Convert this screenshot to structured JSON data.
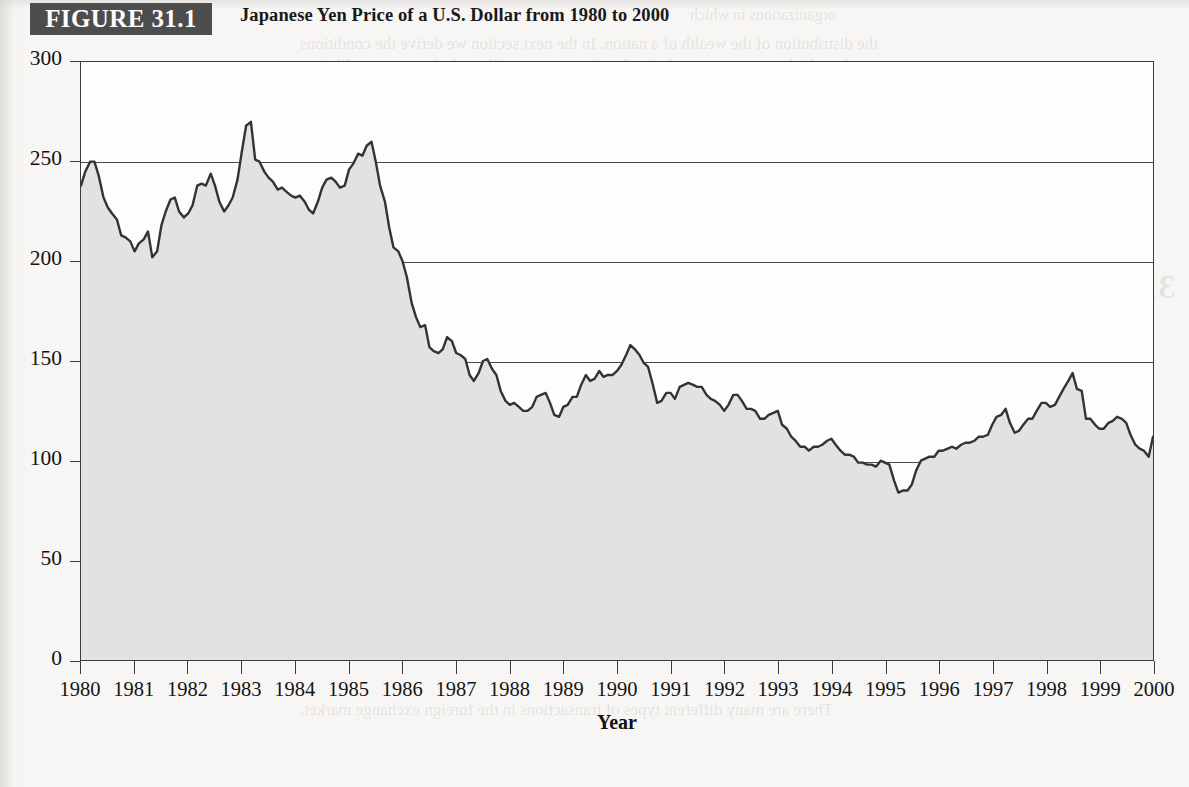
{
  "figure": {
    "tag": "FIGURE 31.1",
    "title": "Japanese Yen Price of a U.S. Dollar from 1980 to 2000"
  },
  "colors": {
    "tag_background": "#4d4d4d",
    "tag_text": "#fdfdfd",
    "line": "#333333",
    "area_fill": "#e2e2e0",
    "plot_background": "#fdfdfc",
    "axis": "#3b3b3b",
    "page_background": "#f7f6f4"
  },
  "axis_title": "Year",
  "chart_data": {
    "type": "area",
    "title": "Japanese Yen Price of a U.S. Dollar from 1980 to 2000",
    "xlabel": "Year",
    "ylabel": "",
    "xlim": [
      1980,
      2000
    ],
    "ylim": [
      0,
      300
    ],
    "yticks": [
      0,
      50,
      100,
      150,
      200,
      250,
      300
    ],
    "ytick_labels": [
      "0",
      "50",
      "100",
      "150",
      "200",
      "250",
      "300"
    ],
    "xticks": [
      1980,
      1981,
      1982,
      1983,
      1984,
      1985,
      1986,
      1987,
      1988,
      1989,
      1990,
      1991,
      1992,
      1993,
      1994,
      1995,
      1996,
      1997,
      1998,
      1999,
      2000
    ],
    "xtick_labels": [
      "1980",
      "1981",
      "1982",
      "1983",
      "1984",
      "1985",
      "1986",
      "1987",
      "1988",
      "1989",
      "1990",
      "1991",
      "1992",
      "1993",
      "1994",
      "1995",
      "1996",
      "1997",
      "1998",
      "1999",
      "2000"
    ],
    "grid": "horizontal gridlines at 50,100,150,200,250",
    "legend": null,
    "series_name": "Yen per U.S. Dollar",
    "annotations": [],
    "notes": [
      "Area under the line is shaded light gray.",
      "Sharp depreciation of the dollar after the 1985 Plaza Accord.",
      "All-time low of about 84 yen per dollar in April 1995."
    ],
    "x": [
      1980.0,
      1980.08,
      1980.17,
      1980.25,
      1980.33,
      1980.42,
      1980.5,
      1980.58,
      1980.67,
      1980.75,
      1980.83,
      1980.92,
      1981.0,
      1981.08,
      1981.17,
      1981.25,
      1981.33,
      1981.42,
      1981.5,
      1981.58,
      1981.67,
      1981.75,
      1981.83,
      1981.92,
      1982.0,
      1982.08,
      1982.17,
      1982.25,
      1982.33,
      1982.42,
      1982.5,
      1982.58,
      1982.67,
      1982.75,
      1982.83,
      1982.92,
      1983.0,
      1983.08,
      1983.17,
      1983.25,
      1983.33,
      1983.42,
      1983.5,
      1983.58,
      1983.67,
      1983.75,
      1983.83,
      1983.92,
      1984.0,
      1984.08,
      1984.17,
      1984.25,
      1984.33,
      1984.42,
      1984.5,
      1984.58,
      1984.67,
      1984.75,
      1984.83,
      1984.92,
      1985.0,
      1985.08,
      1985.17,
      1985.25,
      1985.33,
      1985.42,
      1985.5,
      1985.58,
      1985.67,
      1985.75,
      1985.83,
      1985.92,
      1986.0,
      1986.08,
      1986.17,
      1986.25,
      1986.33,
      1986.42,
      1986.5,
      1986.58,
      1986.67,
      1986.75,
      1986.83,
      1986.92,
      1987.0,
      1987.08,
      1987.17,
      1987.25,
      1987.33,
      1987.42,
      1987.5,
      1987.58,
      1987.67,
      1987.75,
      1987.83,
      1987.92,
      1988.0,
      1988.08,
      1988.17,
      1988.25,
      1988.33,
      1988.42,
      1988.5,
      1988.58,
      1988.67,
      1988.75,
      1988.83,
      1988.92,
      1989.0,
      1989.08,
      1989.17,
      1989.25,
      1989.33,
      1989.42,
      1989.5,
      1989.58,
      1989.67,
      1989.75,
      1989.83,
      1989.92,
      1990.0,
      1990.08,
      1990.17,
      1990.25,
      1990.33,
      1990.42,
      1990.5,
      1990.58,
      1990.67,
      1990.75,
      1990.83,
      1990.92,
      1991.0,
      1991.08,
      1991.17,
      1991.25,
      1991.33,
      1991.42,
      1991.5,
      1991.58,
      1991.67,
      1991.75,
      1991.83,
      1991.92,
      1992.0,
      1992.08,
      1992.17,
      1992.25,
      1992.33,
      1992.42,
      1992.5,
      1992.58,
      1992.67,
      1992.75,
      1992.83,
      1992.92,
      1993.0,
      1993.08,
      1993.17,
      1993.25,
      1993.33,
      1993.42,
      1993.5,
      1993.58,
      1993.67,
      1993.75,
      1993.83,
      1993.92,
      1994.0,
      1994.08,
      1994.17,
      1994.25,
      1994.33,
      1994.42,
      1994.5,
      1994.58,
      1994.67,
      1994.75,
      1994.83,
      1994.92,
      1995.0,
      1995.08,
      1995.17,
      1995.25,
      1995.33,
      1995.42,
      1995.5,
      1995.58,
      1995.67,
      1995.75,
      1995.83,
      1995.92,
      1996.0,
      1996.08,
      1996.17,
      1996.25,
      1996.33,
      1996.42,
      1996.5,
      1996.58,
      1996.67,
      1996.75,
      1996.83,
      1996.92,
      1997.0,
      1997.08,
      1997.17,
      1997.25,
      1997.33,
      1997.42,
      1997.5,
      1997.58,
      1997.67,
      1997.75,
      1997.83,
      1997.92,
      1998.0,
      1998.08,
      1998.17,
      1998.25,
      1998.33,
      1998.42,
      1998.5,
      1998.58,
      1998.67,
      1998.75,
      1998.83,
      1998.92,
      1999.0,
      1999.08,
      1999.17,
      1999.25,
      1999.33,
      1999.42,
      1999.5,
      1999.58,
      1999.67,
      1999.75,
      1999.83,
      1999.92,
      2000.0
    ],
    "values": [
      238,
      245,
      250,
      250,
      243,
      232,
      227,
      224,
      221,
      213,
      212,
      210,
      205,
      209,
      211,
      215,
      202,
      205,
      218,
      225,
      231,
      232,
      225,
      222,
      224,
      228,
      238,
      239,
      238,
      244,
      238,
      230,
      225,
      228,
      232,
      241,
      255,
      268,
      270,
      251,
      250,
      245,
      242,
      240,
      236,
      237,
      235,
      233,
      232,
      233,
      230,
      226,
      224,
      230,
      237,
      241,
      242,
      240,
      237,
      238,
      246,
      249,
      254,
      253,
      258,
      260,
      250,
      238,
      230,
      217,
      207,
      205,
      200,
      192,
      179,
      172,
      167,
      168,
      157,
      155,
      154,
      156,
      162,
      160,
      154,
      153,
      151,
      143,
      140,
      144,
      150,
      151,
      146,
      143,
      135,
      130,
      128,
      129,
      127,
      125,
      125,
      127,
      132,
      133,
      134,
      129,
      123,
      122,
      127,
      128,
      132,
      132,
      138,
      143,
      140,
      141,
      145,
      142,
      143,
      143,
      145,
      148,
      153,
      158,
      156,
      153,
      149,
      147,
      138,
      129,
      130,
      134,
      134,
      131,
      137,
      138,
      139,
      138,
      137,
      137,
      133,
      131,
      130,
      128,
      125,
      128,
      133,
      133,
      130,
      126,
      126,
      125,
      121,
      121,
      123,
      124,
      125,
      118,
      116,
      112,
      110,
      107,
      107,
      105,
      107,
      107,
      108,
      110,
      111,
      108,
      105,
      103,
      103,
      102,
      99,
      99,
      98,
      98,
      97,
      100,
      99,
      98,
      90,
      84,
      85,
      85,
      88,
      95,
      100,
      101,
      102,
      102,
      105,
      105,
      106,
      107,
      106,
      108,
      109,
      109,
      110,
      112,
      112,
      113,
      118,
      122,
      123,
      126,
      119,
      114,
      115,
      118,
      121,
      121,
      125,
      129,
      129,
      127,
      128,
      132,
      136,
      140,
      144,
      136,
      135,
      121,
      121,
      118,
      116,
      116,
      119,
      120,
      122,
      121,
      119,
      113,
      108,
      106,
      105,
      102,
      112
    ]
  }
}
